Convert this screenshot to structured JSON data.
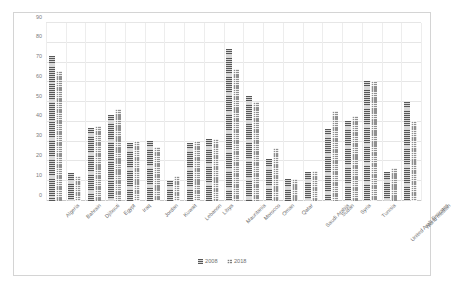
{
  "chart_data": {
    "type": "bar",
    "title": "",
    "subtitle": "",
    "xlabel": "",
    "ylabel": "",
    "ylim": [
      0,
      90
    ],
    "yticks": [
      0,
      10,
      20,
      30,
      40,
      50,
      60,
      70,
      80,
      90
    ],
    "grid": true,
    "legend_position": "bottom",
    "categories": [
      "Algeria",
      "Bahrain",
      "Djibouti",
      "Egypt",
      "Iraq",
      "Jordan",
      "Kuwait",
      "Lebanon",
      "Libya",
      "Mauritania",
      "Morocco",
      "Oman",
      "Qatar",
      "Saudi Arabia",
      "Sudan",
      "Syria",
      "Tunisia",
      "United Arab Emirates",
      "World median"
    ],
    "series": [
      {
        "name": "2008",
        "color": "#8c8c8c",
        "values": [
          73.5,
          14.0,
          37.0,
          43.5,
          29.5,
          30.5,
          10.0,
          29.5,
          31.5,
          77.0,
          53.0,
          21.0,
          11.0,
          14.5,
          36.5,
          40.5,
          60.5,
          14.5,
          50.0
        ]
      },
      {
        "name": "2018",
        "color": "#909090",
        "values": [
          65.5,
          12.5,
          38.0,
          46.5,
          30.5,
          27.5,
          12.5,
          30.5,
          31.5,
          67.0,
          50.0,
          27.0,
          11.0,
          15.0,
          45.5,
          43.0,
          60.5,
          16.5,
          40.5
        ]
      }
    ]
  },
  "legend": {
    "items": [
      {
        "label": "2008",
        "marker": "series-swatch-2008"
      },
      {
        "label": "2018",
        "marker": "series-swatch-2018"
      }
    ]
  }
}
